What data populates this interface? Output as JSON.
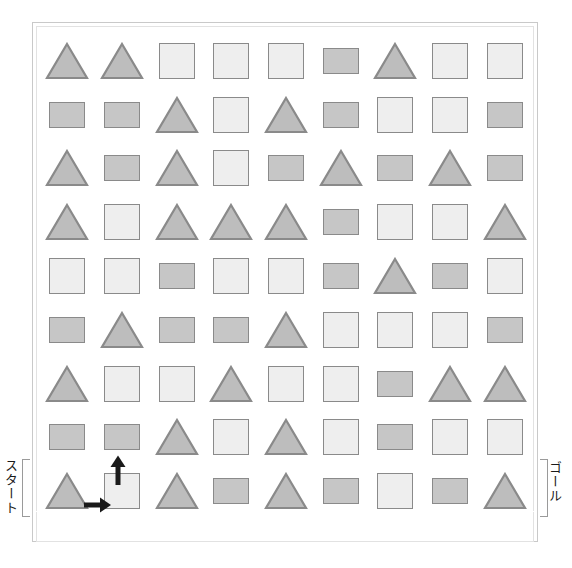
{
  "figure": {
    "title": "",
    "shape_legend": {
      "triangle": "triangle-shape",
      "square": "square-shape",
      "rect": "rectangle-shape"
    },
    "colors": {
      "triangle_fill": "#bdbdbd",
      "square_fill": "#eeeeee",
      "rect_fill": "#c6c6c6",
      "shape_stroke": "#8a8a8a",
      "frame_outer": "#c9c9c9",
      "frame_inner": "#e2e2e2",
      "arrow": "#1a1a1a",
      "bracket": "#9a9a9a",
      "text": "#1a1a1a"
    }
  },
  "labels": {
    "start": "スタート",
    "goal": "ゴール"
  },
  "arrows": [
    {
      "name": "arrow-right",
      "direction": "right",
      "from_cell": "r9c1",
      "to_cell": "r9c2"
    },
    {
      "name": "arrow-up",
      "direction": "up",
      "from_cell": "r9c2",
      "to_cell": "r8c2"
    }
  ],
  "grid": {
    "rows": 9,
    "cols": 9,
    "cells": [
      [
        "triangle",
        "triangle",
        "square",
        "square",
        "square",
        "rect",
        "triangle",
        "square",
        "square"
      ],
      [
        "rect",
        "rect",
        "triangle",
        "square",
        "triangle",
        "rect",
        "square",
        "square",
        "rect"
      ],
      [
        "triangle",
        "rect",
        "triangle",
        "square",
        "rect",
        "triangle",
        "rect",
        "triangle",
        "rect"
      ],
      [
        "triangle",
        "square",
        "triangle",
        "triangle",
        "triangle",
        "rect",
        "square",
        "square",
        "triangle"
      ],
      [
        "square",
        "square",
        "rect",
        "square",
        "square",
        "rect",
        "triangle",
        "rect",
        "square"
      ],
      [
        "rect",
        "triangle",
        "rect",
        "rect",
        "triangle",
        "square",
        "square",
        "square",
        "rect"
      ],
      [
        "triangle",
        "square",
        "square",
        "triangle",
        "square",
        "square",
        "rect",
        "triangle",
        "triangle"
      ],
      [
        "rect",
        "rect",
        "triangle",
        "square",
        "triangle",
        "square",
        "rect",
        "square",
        "square"
      ],
      [
        "triangle",
        "square",
        "triangle",
        "rect",
        "triangle",
        "rect",
        "square",
        "rect",
        "triangle"
      ]
    ]
  }
}
